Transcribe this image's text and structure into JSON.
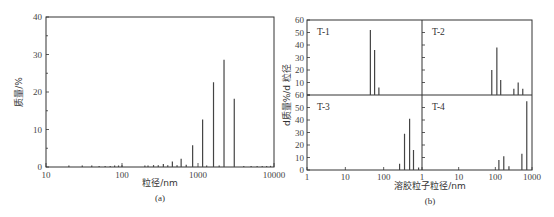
{
  "chart_data": [
    {
      "id": "a",
      "type": "bar",
      "caption": "(a)",
      "xlabel": "粒径/nm",
      "ylabel": "质量/%",
      "xscale": "log",
      "xlim": [
        10,
        10000
      ],
      "ylim": [
        0,
        40
      ],
      "xticks": [
        10,
        100,
        1000,
        10000
      ],
      "xtick_labels": [
        "10",
        "100",
        "1000",
        "10000"
      ],
      "yticks": [
        0,
        10,
        20,
        30,
        40
      ],
      "ytick_labels": [
        "0",
        "10",
        "20",
        "30",
        "40"
      ],
      "grid": false,
      "legend": "none",
      "x": [
        20,
        30,
        40,
        50,
        60,
        70,
        80,
        90,
        100,
        200,
        220,
        260,
        300,
        350,
        400,
        460,
        530,
        600,
        700,
        850,
        1150,
        1300,
        1600,
        1900,
        2200,
        3000,
        4000,
        5000,
        6000,
        7000,
        8000,
        9000
      ],
      "values": [
        0.4,
        0.4,
        0.4,
        0.3,
        0.3,
        0.3,
        0.4,
        0.4,
        0.5,
        0.4,
        0.4,
        0.5,
        0.5,
        0.8,
        0.5,
        1.5,
        0.5,
        2.2,
        0.6,
        5.8,
        12.7,
        0.4,
        22.6,
        0.4,
        28.6,
        18.2,
        0.3,
        0.3,
        0.3,
        0.3,
        0.3,
        0.3
      ]
    },
    {
      "id": "b",
      "type": "bar",
      "caption": "(b)",
      "xlabel": "溶胶粒子粒径/nm",
      "ylabel": "d质量%/d 粒径",
      "xscale": "log",
      "xlim": [
        1,
        1000
      ],
      "ylim": [
        0,
        60
      ],
      "xticks": [
        1,
        10,
        100,
        1000
      ],
      "xtick_labels_left": [
        "1",
        "10",
        "100",
        "1"
      ],
      "xtick_labels_right": [
        "10",
        "100",
        "1000"
      ],
      "yticks_top": [
        "60",
        "50",
        "40",
        "30",
        "20",
        "10"
      ],
      "yticks_bottom": [
        "60",
        "50",
        "40",
        "30",
        "20",
        "10",
        "0"
      ],
      "grid": false,
      "legend": "none",
      "panels": [
        {
          "name": "T-1",
          "position": "top-left",
          "x": [
            45,
            58,
            75
          ],
          "values": [
            52,
            36,
            6
          ]
        },
        {
          "name": "T-2",
          "position": "top-right",
          "x": [
            80,
            110,
            140,
            320,
            420,
            560
          ],
          "values": [
            20,
            38,
            12,
            5,
            10,
            5
          ]
        },
        {
          "name": "T-3",
          "position": "bottom-left",
          "x": [
            260,
            350,
            475,
            600,
            815
          ],
          "values": [
            5,
            29,
            41,
            16,
            2
          ]
        },
        {
          "name": "T-4",
          "position": "bottom-right",
          "x": [
            125,
            170,
            235,
            530,
            720
          ],
          "values": [
            8,
            11,
            3,
            13,
            55
          ]
        }
      ]
    }
  ]
}
